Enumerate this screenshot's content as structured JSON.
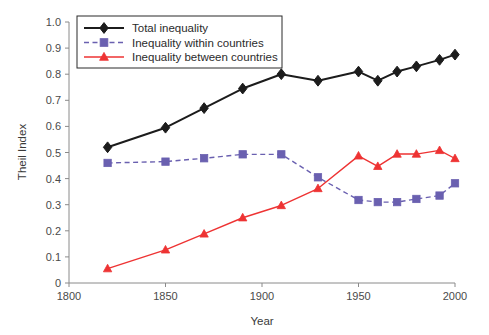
{
  "chart_data": {
    "type": "line",
    "title": "",
    "xlabel": "Year",
    "ylabel": "Theil Index",
    "xlim": [
      1800,
      2000
    ],
    "ylim": [
      0,
      1.0
    ],
    "xticks": [
      1800,
      1850,
      1900,
      1950,
      2000
    ],
    "xtick_labels": [
      "1800",
      "1850",
      "1900",
      "1950",
      "2000"
    ],
    "yticks": [
      0,
      0.1,
      0.2,
      0.3,
      0.4,
      0.5,
      0.6,
      0.7,
      0.8,
      0.9,
      1.0
    ],
    "ytick_labels": [
      "0",
      "0.1",
      "0.2",
      "0.3",
      "0.4",
      "0.5",
      "0.6",
      "0.7",
      "0.8",
      "0.9",
      "1.0"
    ],
    "grid": false,
    "legend_position": "upper-left",
    "series": [
      {
        "name": "Total inequality",
        "color": "#1c1c1c",
        "marker": "diamond",
        "linestyle": "solid",
        "x": [
          1820,
          1850,
          1870,
          1890,
          1910,
          1929,
          1950,
          1960,
          1970,
          1980,
          1992,
          2000
        ],
        "values": [
          0.52,
          0.595,
          0.67,
          0.745,
          0.8,
          0.775,
          0.81,
          0.775,
          0.81,
          0.83,
          0.855,
          0.875
        ]
      },
      {
        "name": "Inequality within countries",
        "color": "#6a60b0",
        "marker": "square",
        "linestyle": "dashed",
        "x": [
          1820,
          1850,
          1870,
          1890,
          1910,
          1929,
          1950,
          1960,
          1970,
          1980,
          1992,
          2000
        ],
        "values": [
          0.46,
          0.465,
          0.478,
          0.493,
          0.493,
          0.405,
          0.318,
          0.31,
          0.31,
          0.322,
          0.335,
          0.382
        ]
      },
      {
        "name": "Inequality between countries",
        "color": "#ee3333",
        "marker": "triangle",
        "linestyle": "solid",
        "x": [
          1820,
          1850,
          1870,
          1890,
          1910,
          1929,
          1950,
          1960,
          1970,
          1980,
          1992,
          2000
        ],
        "values": [
          0.055,
          0.127,
          0.188,
          0.25,
          0.297,
          0.362,
          0.487,
          0.447,
          0.494,
          0.494,
          0.508,
          0.477
        ]
      }
    ]
  },
  "legend": {
    "items": [
      {
        "label": "Total inequality"
      },
      {
        "label": "Inequality within countries"
      },
      {
        "label": "Inequality between countries"
      }
    ]
  }
}
